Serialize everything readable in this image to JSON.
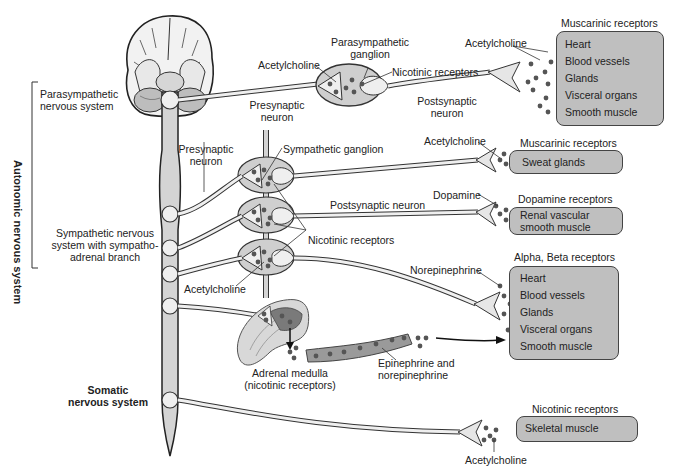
{
  "labels": {
    "autonomic_nervous_system": "Autonomic nervous system",
    "parasympathetic_nervous_system": [
      "Parasympathetic",
      "nervous system"
    ],
    "sympathetic_nervous_system": [
      "Sympathetic nervous",
      "system with sympatho-",
      "adrenal branch"
    ],
    "somatic_nervous_system": [
      "Somatic",
      "nervous system"
    ],
    "presynaptic_neuron_para": [
      "Presynaptic",
      "neuron"
    ],
    "presynaptic_neuron_symp": [
      "Presynaptic",
      "neuron"
    ],
    "postsynaptic_neuron_para": [
      "Postsynaptic",
      "neuron"
    ],
    "postsynaptic_neuron_symp": "Postsynaptic neuron",
    "parasympathetic_ganglion": [
      "Parasympathetic",
      "ganglion"
    ],
    "sympathetic_ganglion": "Sympathetic ganglion",
    "acetylcholine_para_ganglion": "Acetylcholine",
    "acetylcholine_para_target": "Acetylcholine",
    "acetylcholine_symp_sweat": "Acetylcholine",
    "acetylcholine_symp_ganglion": "Acetylcholine",
    "acetylcholine_somatic": "Acetylcholine",
    "nicotinic_receptors_para": "Nicotinic receptors",
    "nicotinic_receptors_symp": "Nicotinic receptors",
    "dopamine": "Dopamine",
    "norepinephrine": "Norepinephrine",
    "adrenal_medulla": [
      "Adrenal medulla",
      "(nicotinic receptors)"
    ],
    "epinephrine_norepinephrine": [
      "Epinephrine and",
      "norepinephrine"
    ]
  },
  "targets": [
    {
      "receptor": "Muscarinic receptors",
      "organs": [
        "Heart",
        "Blood vessels",
        "Glands",
        "Visceral organs",
        "Smooth muscle"
      ]
    },
    {
      "receptor": "Muscarinic receptors",
      "organs": [
        "Sweat glands"
      ]
    },
    {
      "receptor": "Dopamine receptors",
      "organs": [
        "Renal vascular",
        "smooth muscle"
      ]
    },
    {
      "receptor": "Alpha, Beta receptors",
      "organs": [
        "Heart",
        "Blood vessels",
        "Glands",
        "Visceral organs",
        "Smooth muscle"
      ]
    },
    {
      "receptor": "Nicotinic receptors",
      "organs": [
        "Skeletal muscle"
      ]
    }
  ],
  "colors": {
    "box_fill": "#bfbfbf",
    "ganglion_fill": "#cfcfcf",
    "neuron_fill": "#e6e6e6",
    "outline": "#333333",
    "dot": "#555555"
  }
}
